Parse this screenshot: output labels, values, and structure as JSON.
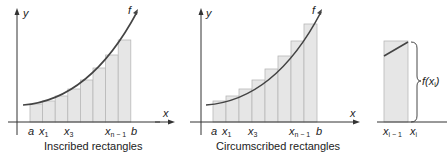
{
  "figure": {
    "panels": [
      {
        "id": "inscribed",
        "caption": "Inscribed rectangles",
        "axis_y_label": "y",
        "curve_label": "f",
        "tick_labels": [
          "a",
          "x",
          "x",
          "x",
          "b"
        ],
        "tick_subscripts": [
          "",
          "1",
          "3",
          "n − 1",
          ""
        ]
      },
      {
        "id": "circumscribed",
        "caption": "Circumscribed rectangles",
        "axis_y_label": "y",
        "axis_x_label": "x",
        "curve_label": "f",
        "tick_labels": [
          "a",
          "x",
          "x",
          "x",
          "b"
        ],
        "tick_subscripts": [
          "",
          "1",
          "3",
          "n − 1",
          ""
        ]
      },
      {
        "id": "detail",
        "axis_x_label": "x",
        "height_label": "f(x",
        "height_label_sub": "i",
        "height_label_end": ")",
        "tick_labels": [
          "x",
          "x"
        ],
        "tick_subscripts": [
          "i − 1",
          "i"
        ]
      }
    ],
    "colors": {
      "rect_fill": "#e6e6e6",
      "rect_stroke": "#b8b8b8",
      "curve": "#444444",
      "axis": "#333333"
    }
  }
}
